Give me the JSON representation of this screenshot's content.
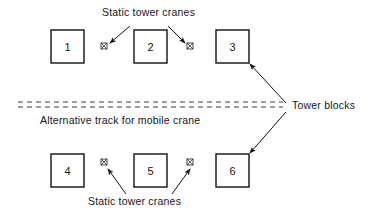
{
  "diagram": {
    "background_color": "#ffffff",
    "line_color": "#141414",
    "labels": {
      "static_cranes_top": "Static tower cranes",
      "static_cranes_bottom": "Static tower cranes",
      "alternative_track": "Alternative track for mobile crane",
      "tower_blocks": "Tower blocks"
    },
    "blocks": [
      {
        "id": "block-1",
        "label": "1",
        "x": 51,
        "y": 30,
        "w": 33,
        "h": 33
      },
      {
        "id": "block-2",
        "label": "2",
        "x": 134,
        "y": 30,
        "w": 33,
        "h": 33
      },
      {
        "id": "block-3",
        "label": "3",
        "x": 216,
        "y": 30,
        "w": 33,
        "h": 33
      },
      {
        "id": "block-4",
        "label": "4",
        "x": 51,
        "y": 154,
        "w": 33,
        "h": 33
      },
      {
        "id": "block-5",
        "label": "5",
        "x": 134,
        "y": 154,
        "w": 33,
        "h": 33
      },
      {
        "id": "block-6",
        "label": "6",
        "x": 216,
        "y": 154,
        "w": 33,
        "h": 33
      }
    ],
    "cranes": [
      {
        "id": "crane-top-left",
        "x": 104,
        "y": 46,
        "size": 6
      },
      {
        "id": "crane-top-right",
        "x": 190,
        "y": 46,
        "size": 6
      },
      {
        "id": "crane-bottom-left",
        "x": 104,
        "y": 162,
        "size": 6
      },
      {
        "id": "crane-bottom-right",
        "x": 190,
        "y": 162,
        "size": 6
      }
    ],
    "track": {
      "line_1_y": 102,
      "line_2_y": 107,
      "x_start": 18,
      "x_end": 283,
      "dash": "5 4"
    },
    "text_positions": {
      "static_cranes_top": {
        "x": 102,
        "y": 16
      },
      "static_cranes_bottom": {
        "x": 88,
        "y": 205
      },
      "alternative_track": {
        "x": 40,
        "y": 124
      },
      "tower_blocks": {
        "x": 292,
        "y": 109
      }
    }
  }
}
